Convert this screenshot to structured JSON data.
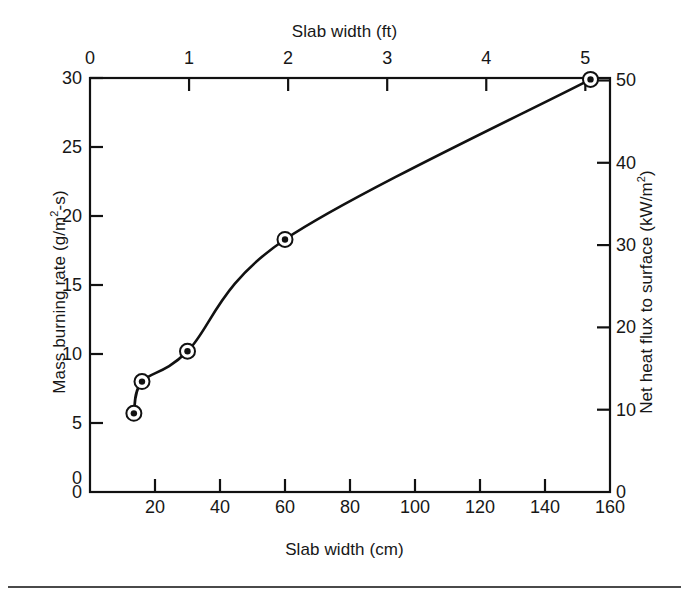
{
  "figure": {
    "background": "#ffffff",
    "line_color": "#111111",
    "marker_face": "#111111",
    "marker_edge": "#111111"
  },
  "axes": {
    "top": {
      "title": "Slab width (ft)",
      "unit": "ft",
      "ticks": [
        0,
        1,
        2,
        3,
        4,
        5
      ],
      "tick_labels": [
        "0",
        "1",
        "2",
        "3",
        "4",
        "5"
      ],
      "range": [
        0,
        5.249
      ]
    },
    "bottom": {
      "title": "Slab width (cm)",
      "unit": "cm",
      "ticks": [
        0,
        20,
        40,
        60,
        80,
        100,
        120,
        140,
        160
      ],
      "tick_labels": [
        "0",
        "20",
        "40",
        "60",
        "80",
        "100",
        "120",
        "140",
        "160"
      ],
      "labeled_ticks": [
        "20",
        "40",
        "60",
        "80",
        "100",
        "120",
        "140",
        "160"
      ],
      "corner_label": "0",
      "range": [
        0,
        160
      ]
    },
    "left": {
      "title": "Mass burning rate (g/m",
      "title_sup": "2",
      "title_tail": "-s)",
      "title_full": "Mass burning rate (g/m2-s)",
      "ticks": [
        0,
        5,
        10,
        15,
        20,
        25,
        30
      ],
      "tick_labels": [
        "0",
        "5",
        "10",
        "15",
        "20",
        "25",
        "30"
      ],
      "range": [
        0,
        30
      ]
    },
    "right": {
      "title": "Net heat flux to surface (kW/m",
      "title_sup": "2",
      "title_tail": ")",
      "title_full": "Net heat flux to surface (kW/m2)",
      "ticks": [
        0,
        10,
        20,
        30,
        40,
        50
      ],
      "tick_labels": [
        "0",
        "10",
        "20",
        "30",
        "40",
        "50"
      ],
      "range": [
        0,
        50.3
      ]
    }
  },
  "chart_data": {
    "type": "line",
    "title": "",
    "xlabel": "Slab width (cm)",
    "ylabel": "Mass burning rate (g/m2-s)",
    "xlim": [
      0,
      160
    ],
    "ylim": [
      0,
      30
    ],
    "grid": false,
    "legend": null,
    "secondary_xaxis": {
      "label": "Slab width (ft)",
      "lim": [
        0,
        5.25
      ],
      "ticks": [
        0,
        1,
        2,
        3,
        4,
        5
      ]
    },
    "secondary_yaxis": {
      "label": "Net heat flux to surface (kW/m2)",
      "lim": [
        0,
        50.3
      ],
      "ticks": [
        0,
        10,
        20,
        30,
        40,
        50
      ]
    },
    "series": [
      {
        "name": "Mass burning rate vs slab width",
        "marker": "circle-with-dot",
        "points": [
          {
            "x": 13.5,
            "y": 5.7,
            "y_right": 9.6
          },
          {
            "x": 16.0,
            "y": 8.0,
            "y_right": 13.4
          },
          {
            "x": 30.0,
            "y": 10.2,
            "y_right": 17.1
          },
          {
            "x": 60.0,
            "y": 18.3,
            "y_right": 30.7
          },
          {
            "x": 154.0,
            "y": 29.9,
            "y_right": 50.1
          }
        ],
        "x": [
          13.5,
          16.0,
          30.0,
          60.0,
          154.0
        ],
        "values": [
          5.7,
          8.0,
          10.2,
          18.3,
          29.9
        ]
      }
    ],
    "curve_description": "Smooth concave-down curve rising from about 5.7 g/m2-s at 13.5 cm to about 29.9 g/m2-s at 154 cm"
  }
}
